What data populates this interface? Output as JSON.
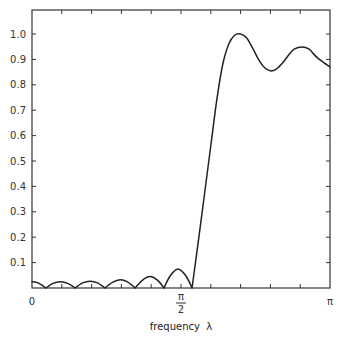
{
  "chart_data": {
    "type": "line",
    "title": "",
    "xlabel": "frequency  λ",
    "ylabel": "",
    "xlim": [
      0,
      3.14159
    ],
    "ylim": [
      0,
      1.0
    ],
    "grid": false,
    "legend": null,
    "x_tick_labels": [
      {
        "value": 0,
        "label": "0"
      },
      {
        "value": 1.5708,
        "label_num": "π",
        "label_den": "2"
      },
      {
        "value": 3.14159,
        "label": "π"
      }
    ],
    "x_minor_ticks_step_over_pi": 0.1,
    "y_ticks": [
      0.1,
      0.2,
      0.3,
      0.4,
      0.5,
      0.6,
      0.7,
      0.8,
      0.9,
      1.0
    ],
    "y_tick_labels": [
      "0.1",
      "0.2",
      "0.3",
      "0.4",
      "0.5",
      "0.6",
      "0.7",
      "0.8",
      "0.9",
      "1.0"
    ],
    "series": [
      {
        "name": "frequency response",
        "x_over_pi": [
          0.0,
          0.02,
          0.047,
          0.07,
          0.096,
          0.12,
          0.145,
          0.17,
          0.195,
          0.22,
          0.245,
          0.27,
          0.296,
          0.32,
          0.346,
          0.37,
          0.395,
          0.42,
          0.443,
          0.465,
          0.49,
          0.515,
          0.537,
          0.56,
          0.58,
          0.6,
          0.62,
          0.64,
          0.66,
          0.68,
          0.7,
          0.72,
          0.74,
          0.76,
          0.78,
          0.8,
          0.82,
          0.84,
          0.86,
          0.88,
          0.906,
          0.93,
          0.95,
          0.97,
          1.0
        ],
        "values": [
          0.025,
          0.02,
          0.0,
          0.018,
          0.025,
          0.018,
          0.0,
          0.02,
          0.027,
          0.02,
          0.0,
          0.022,
          0.032,
          0.024,
          0.0,
          0.03,
          0.045,
          0.032,
          0.0,
          0.05,
          0.075,
          0.05,
          0.0,
          0.2,
          0.38,
          0.56,
          0.74,
          0.88,
          0.96,
          0.995,
          1.0,
          0.985,
          0.945,
          0.9,
          0.868,
          0.855,
          0.862,
          0.885,
          0.915,
          0.94,
          0.949,
          0.94,
          0.915,
          0.895,
          0.87
        ]
      }
    ]
  }
}
